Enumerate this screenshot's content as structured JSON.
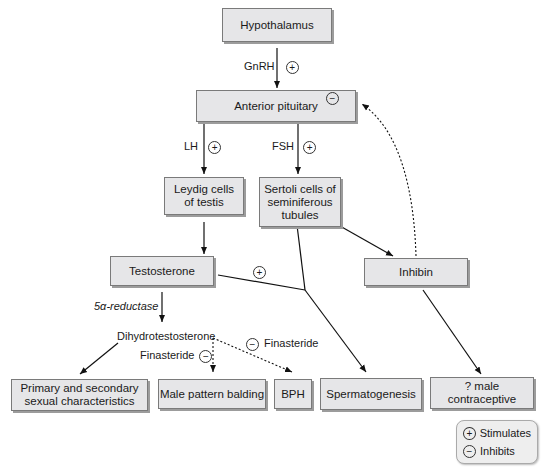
{
  "boxes": {
    "hypothalamus": "Hypothalamus",
    "anterior_pituitary": "Anterior pituitary",
    "leydig": "Leydig cells of testis",
    "sertoli": "Sertoli cells of seminiferous tubules",
    "testosterone": "Testosterone",
    "inhibin": "Inhibin",
    "primary_secondary": "Primary and secondary sexual characteristics",
    "male_pattern_balding": "Male pattern balding",
    "bph": "BPH",
    "spermatogenesis": "Spermatogenesis",
    "male_contraceptive": "? male contraceptive"
  },
  "labels": {
    "gnrh": "GnRH",
    "lh": "LH",
    "fsh": "FSH",
    "five_alpha_reductase": "5α-reductase",
    "dihydrotestosterone": "Dihydrotestosterone",
    "finasteride_left": "Finasteride",
    "finasteride_right": "Finasteride"
  },
  "signs": {
    "plus": "+",
    "minus": "−"
  },
  "legend": {
    "stimulates": "Stimulates",
    "inhibits": "Inhibits"
  }
}
